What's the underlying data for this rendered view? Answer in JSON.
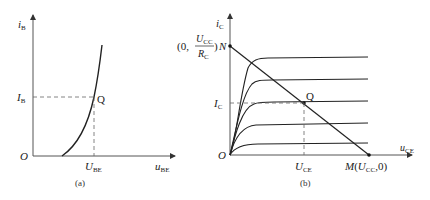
{
  "figure_a": {
    "caption": "(a)",
    "y_axis": {
      "var": "i",
      "sub": "B"
    },
    "x_axis": {
      "var": "u",
      "sub": "BE"
    },
    "origin": "O",
    "q_label": "Q",
    "ib_label": {
      "var": "I",
      "sub": "B"
    },
    "ube_label": {
      "var": "U",
      "sub": "BE"
    }
  },
  "figure_b": {
    "caption": "(b)",
    "y_axis": {
      "var": "i",
      "sub": "C"
    },
    "x_axis": {
      "var": "u",
      "sub": "CE"
    },
    "origin": "O",
    "q_label": "Q",
    "n_point": {
      "prefix": "(0,",
      "num_var": "U",
      "num_sub": "CC",
      "den_var": "R",
      "den_sub": "C",
      "suffix": ")",
      "name": "N"
    },
    "m_point": {
      "name": "M",
      "open": "(",
      "var": "U",
      "sub": "CC",
      "rest": ",0)"
    },
    "ic_label": {
      "var": "I",
      "sub": "C"
    },
    "uce_label": {
      "var": "U",
      "sub": "CE"
    },
    "curve_count": 5
  }
}
